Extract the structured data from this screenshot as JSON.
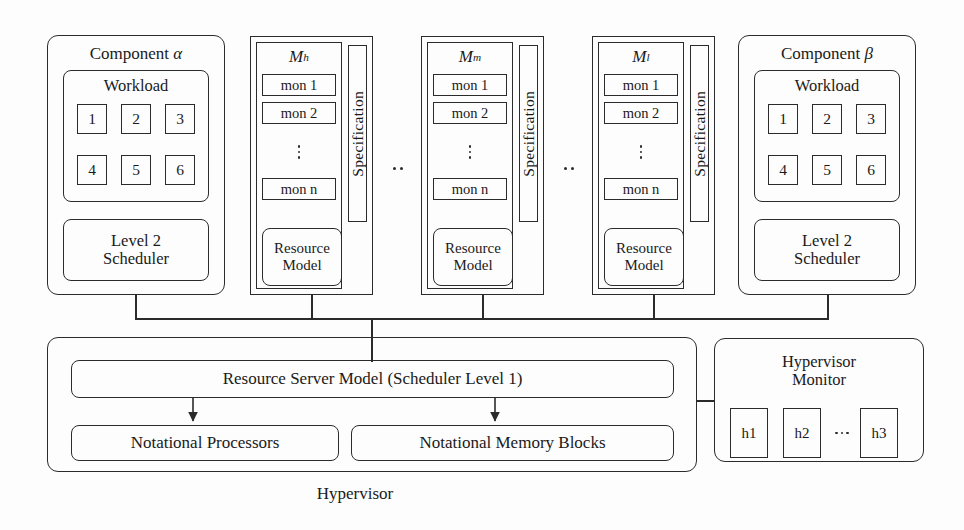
{
  "diagram": {
    "caption": "Hypervisor",
    "components": [
      {
        "title_prefix": "Component",
        "title_symbol": "α",
        "workload": {
          "label": "Workload",
          "tasks": [
            "1",
            "2",
            "3",
            "4",
            "5",
            "6"
          ]
        },
        "scheduler": {
          "line1": "Level 2",
          "line2": "Scheduler"
        }
      },
      {
        "title_prefix": "Component",
        "title_symbol": "β",
        "workload": {
          "label": "Workload",
          "tasks": [
            "1",
            "2",
            "3",
            "4",
            "5",
            "6"
          ]
        },
        "scheduler": {
          "line1": "Level 2",
          "line2": "Scheduler"
        }
      }
    ],
    "monitors": [
      {
        "title_base": "M",
        "title_sup": "h",
        "items": [
          "mon 1",
          "mon 2"
        ],
        "last_item": "mon n",
        "spec_label": "Specification",
        "resource_model": {
          "line1": "Resource",
          "line2": "Model"
        }
      },
      {
        "title_base": "M",
        "title_sup": "m",
        "items": [
          "mon 1",
          "mon 2"
        ],
        "last_item": "mon n",
        "spec_label": "Specification",
        "resource_model": {
          "line1": "Resource",
          "line2": "Model"
        }
      },
      {
        "title_base": "M",
        "title_sup": "l",
        "items": [
          "mon 1",
          "mon 2"
        ],
        "last_item": "mon n",
        "spec_label": "Specification",
        "resource_model": {
          "line1": "Resource",
          "line2": "Model"
        }
      }
    ],
    "monitor_separators": [
      "..",
      ".."
    ],
    "hypervisor": {
      "server_model": "Resource Server Model (Scheduler Level 1)",
      "processors": "Notational Processors",
      "memory_blocks": "Notational Memory Blocks"
    },
    "hypervisor_monitor": {
      "title_line1": "Hypervisor",
      "title_line2": "Monitor",
      "handles": [
        "h1",
        "h2",
        "h3"
      ],
      "handle_ellipsis": "⋯"
    },
    "colors": {
      "stroke": "#2b2b2b",
      "background": "#fdfdfd"
    }
  }
}
